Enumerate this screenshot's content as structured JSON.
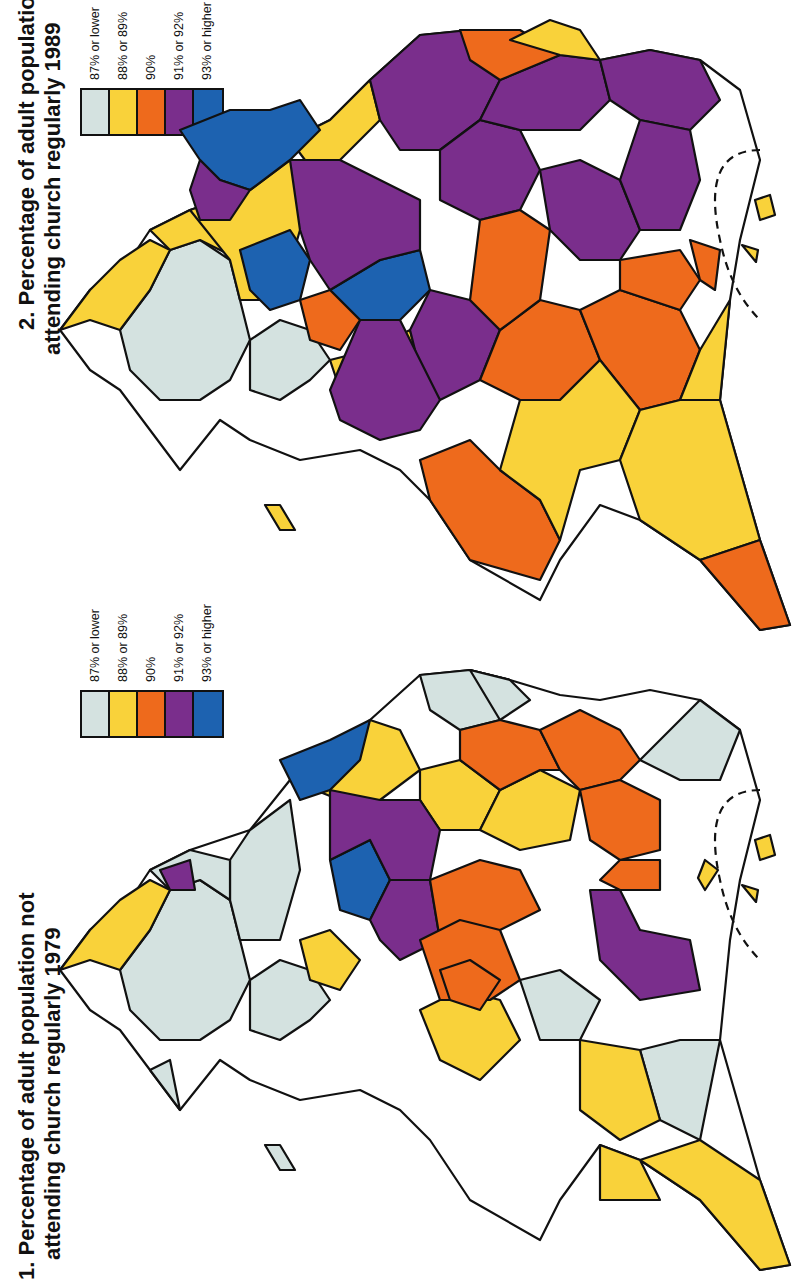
{
  "orientation": "rotated 90° counter-clockwise",
  "colors": {
    "c87": "#d4e2e0",
    "c88_89": "#f9d23a",
    "c90": "#ee6a1c",
    "c91_92": "#7a2e8c",
    "c93": "#1d62b0",
    "outline": "#111111"
  },
  "maps": [
    {
      "id": "map-1989",
      "title_line1": "2. Percentage of adult population not",
      "title_line2": "attending church regularly 1989",
      "legend": [
        {
          "label": "87% or lower",
          "color": "#d4e2e0"
        },
        {
          "label": "88% or 89%",
          "color": "#f9d23a"
        },
        {
          "label": "90%",
          "color": "#ee6a1c"
        },
        {
          "label": "91% or 92%",
          "color": "#7a2e8c"
        },
        {
          "label": "93% or higher",
          "color": "#1d62b0"
        }
      ]
    },
    {
      "id": "map-1979",
      "title_line1": "1. Percentage of adult population not",
      "title_line2": "attending church regularly 1979",
      "legend": [
        {
          "label": "87% or lower",
          "color": "#d4e2e0"
        },
        {
          "label": "88% or 89%",
          "color": "#f9d23a"
        },
        {
          "label": "90%",
          "color": "#ee6a1c"
        },
        {
          "label": "91% or 92%",
          "color": "#7a2e8c"
        },
        {
          "label": "93% or higher",
          "color": "#1d62b0"
        }
      ]
    }
  ]
}
